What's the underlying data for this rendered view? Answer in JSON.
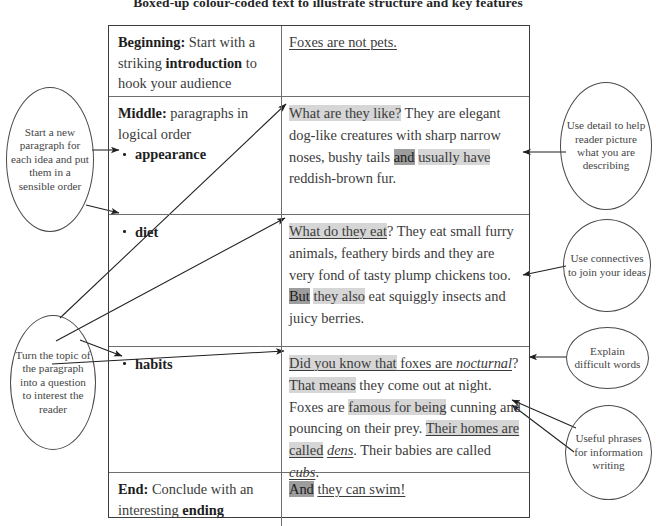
{
  "title": "Boxed-up colour-coded text to illustrate structure and key features",
  "table": {
    "rows": [
      {
        "id": "beginning",
        "label_html": "<b>Beginning:</b> Start with a striking <b>introduction</b> to hook your audience",
        "label_plain": "Beginning: Start with a striking introduction to hook your audience",
        "text_plain": "Foxes are not pets.",
        "segments": [
          {
            "t": "Foxes are not pets.",
            "style": "underline"
          }
        ]
      },
      {
        "id": "middle-appearance",
        "label_html": "<b>Middle:</b> paragraphs in logical order",
        "label_plain": "Middle: paragraphs in logical order",
        "sublabel": "appearance",
        "text_plain": "What are they like? They are elegant dog-like creatures with sharp narrow noses, bushy tails and usually have reddish-brown fur.",
        "segments": [
          {
            "t": "What are they like?",
            "style": "highlight-light"
          },
          {
            "t": " They are elegant dog-like creatures with sharp narrow noses, bushy tails ",
            "style": "plain"
          },
          {
            "t": "and",
            "style": "highlight-dark"
          },
          {
            "t": " ",
            "style": "plain"
          },
          {
            "t": "usually have",
            "style": "highlight-light"
          },
          {
            "t": " reddish-brown fur.",
            "style": "plain"
          }
        ]
      },
      {
        "id": "diet",
        "label_html": "",
        "label_plain": "",
        "sublabel": "diet",
        "text_plain": "What do they eat? They eat small furry animals, feathery birds and they are very fond of tasty plump chickens too. But they also eat squiggly insects and juicy berries.",
        "segments": [
          {
            "t": "What do they eat",
            "style": "highlight-light-underline"
          },
          {
            "t": "? They eat small furry animals, feathery birds and they are very fond of tasty plump chickens too. ",
            "style": "plain"
          },
          {
            "t": "But",
            "style": "highlight-dark"
          },
          {
            "t": " ",
            "style": "plain"
          },
          {
            "t": "they also",
            "style": "highlight-light"
          },
          {
            "t": " eat squiggly insects and juicy berries.",
            "style": "plain"
          }
        ]
      },
      {
        "id": "habits",
        "label_html": "",
        "label_plain": "",
        "sublabel": "habits",
        "text_plain": "Did you know that foxes are nocturnal? That means they come out at night. Foxes are famous for being cunning and pouncing on their prey. Their homes are called dens. Their babies are called cubs.",
        "segments": [
          {
            "t": "Did you know that",
            "style": "highlight-light-underline"
          },
          {
            "t": " foxes are ",
            "style": "underline"
          },
          {
            "t": "nocturnal",
            "style": "italic-underline"
          },
          {
            "t": "? ",
            "style": "plain"
          },
          {
            "t": "That means",
            "style": "highlight-light"
          },
          {
            "t": " they come out at night. Foxes are ",
            "style": "plain"
          },
          {
            "t": "famous for being",
            "style": "highlight-light"
          },
          {
            "t": " cunning and pouncing on their prey. ",
            "style": "plain"
          },
          {
            "t": "Their homes are called",
            "style": "highlight-light-underline"
          },
          {
            "t": " ",
            "style": "plain"
          },
          {
            "t": "dens",
            "style": "italic-underline"
          },
          {
            "t": ". Their babies are called ",
            "style": "plain"
          },
          {
            "t": "cubs",
            "style": "italic-underline"
          },
          {
            "t": ".",
            "style": "plain"
          }
        ]
      },
      {
        "id": "end",
        "label_html": "<b>End:</b> Conclude with an interesting <b>ending</b>",
        "label_plain": "End: Conclude with an interesting ending",
        "text_plain": "And they can swim!",
        "segments": [
          {
            "t": "And",
            "style": "highlight-dark"
          },
          {
            "t": " ",
            "style": "plain"
          },
          {
            "t": "they can swim!",
            "style": "underline"
          }
        ]
      }
    ]
  },
  "callouts": {
    "left": [
      {
        "id": "start-new-paragraph",
        "text": "Start a new paragraph for each idea and put them in a sensible order"
      },
      {
        "id": "turn-topic-into-question",
        "text": "Turn the topic of the paragraph into a question to interest the reader"
      }
    ],
    "right": [
      {
        "id": "use-detail",
        "text": "Use detail to help reader picture what you are describing"
      },
      {
        "id": "use-connectives",
        "text": "Use connectives to join your ideas"
      },
      {
        "id": "explain-difficult-words",
        "text": "Explain difficult words"
      },
      {
        "id": "useful-phrases",
        "text": "Useful phrases for information writing"
      }
    ]
  },
  "colors": {
    "ink": "#3b3b3b",
    "rule": "#6e6e6e",
    "outer_rule": "#3d3d3d",
    "highlight_light": "#d6d6d6",
    "highlight_dark": "#9d9d9d"
  }
}
